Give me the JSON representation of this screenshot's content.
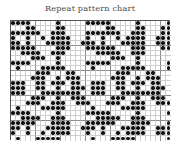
{
  "title": "Repeat pattern chart",
  "colors": {
    "title": "#4a4a4a",
    "dot": "#111111",
    "grid_minor": "#cfcfcf",
    "grid_major": "#8d8d8d",
    "border": "#555555",
    "background": "#ffffff"
  },
  "chart_data": {
    "type": "heatmap",
    "title": "Repeat pattern chart",
    "xlabel": "",
    "ylabel": "",
    "grid": true,
    "legend": "none",
    "columns": 32,
    "rows": 24,
    "major_every": 5,
    "symbol": "filled-dot",
    "values": [
      [
        1,
        1,
        1,
        1,
        0,
        0,
        0,
        0,
        0,
        1,
        0,
        0,
        0,
        0,
        0,
        1,
        1,
        1,
        1,
        1,
        0,
        0,
        0,
        0,
        0,
        1,
        0,
        0,
        0,
        0,
        0,
        1
      ],
      [
        0,
        0,
        0,
        1,
        1,
        0,
        0,
        0,
        0,
        1,
        1,
        0,
        0,
        0,
        0,
        0,
        0,
        0,
        0,
        1,
        1,
        0,
        0,
        0,
        0,
        1,
        1,
        0,
        0,
        0,
        1,
        1
      ],
      [
        1,
        1,
        1,
        1,
        1,
        1,
        0,
        0,
        1,
        1,
        1,
        0,
        0,
        0,
        0,
        1,
        1,
        1,
        1,
        1,
        1,
        1,
        0,
        0,
        1,
        1,
        1,
        0,
        0,
        0,
        1,
        1
      ],
      [
        1,
        0,
        0,
        1,
        0,
        0,
        1,
        0,
        1,
        1,
        1,
        1,
        0,
        0,
        0,
        1,
        0,
        0,
        1,
        0,
        0,
        1,
        0,
        1,
        1,
        1,
        1,
        0,
        0,
        1,
        1,
        1
      ],
      [
        1,
        1,
        0,
        1,
        0,
        0,
        0,
        1,
        1,
        1,
        1,
        1,
        0,
        0,
        1,
        1,
        1,
        0,
        1,
        0,
        0,
        0,
        1,
        1,
        1,
        1,
        1,
        0,
        0,
        1,
        1,
        1
      ],
      [
        1,
        1,
        1,
        1,
        1,
        0,
        0,
        0,
        0,
        1,
        1,
        1,
        0,
        0,
        0,
        1,
        1,
        1,
        1,
        1,
        1,
        0,
        0,
        0,
        1,
        1,
        1,
        0,
        0,
        0,
        1,
        1
      ],
      [
        0,
        0,
        1,
        1,
        1,
        1,
        0,
        0,
        1,
        1,
        1,
        0,
        0,
        0,
        0,
        0,
        0,
        1,
        1,
        1,
        1,
        1,
        0,
        0,
        1,
        1,
        1,
        0,
        0,
        0,
        0,
        0
      ],
      [
        0,
        0,
        0,
        0,
        1,
        1,
        1,
        0,
        0,
        1,
        0,
        0,
        0,
        0,
        0,
        0,
        0,
        0,
        0,
        0,
        1,
        1,
        1,
        0,
        0,
        1,
        0,
        0,
        0,
        0,
        0,
        0
      ],
      [
        1,
        1,
        1,
        1,
        0,
        0,
        0,
        0,
        0,
        1,
        0,
        0,
        0,
        0,
        0,
        1,
        1,
        1,
        1,
        1,
        0,
        0,
        0,
        0,
        0,
        1,
        0,
        0,
        0,
        0,
        0,
        1
      ],
      [
        0,
        1,
        0,
        0,
        0,
        0,
        1,
        1,
        1,
        1,
        1,
        0,
        0,
        0,
        0,
        0,
        1,
        0,
        0,
        0,
        0,
        0,
        1,
        1,
        1,
        1,
        1,
        0,
        0,
        0,
        0,
        1
      ],
      [
        0,
        0,
        0,
        0,
        0,
        1,
        1,
        1,
        0,
        0,
        0,
        1,
        1,
        0,
        0,
        0,
        0,
        0,
        0,
        0,
        0,
        1,
        1,
        1,
        0,
        0,
        0,
        1,
        1,
        0,
        0,
        0
      ],
      [
        0,
        0,
        0,
        0,
        1,
        1,
        1,
        0,
        0,
        1,
        0,
        1,
        1,
        1,
        0,
        0,
        0,
        0,
        0,
        0,
        1,
        1,
        1,
        0,
        0,
        1,
        0,
        1,
        1,
        1,
        0,
        0
      ],
      [
        1,
        1,
        1,
        0,
        0,
        1,
        1,
        0,
        1,
        1,
        1,
        0,
        1,
        1,
        0,
        0,
        1,
        1,
        1,
        0,
        0,
        1,
        1,
        0,
        1,
        1,
        1,
        0,
        1,
        1,
        0,
        0
      ],
      [
        1,
        1,
        1,
        0,
        0,
        1,
        1,
        0,
        0,
        1,
        0,
        0,
        1,
        1,
        1,
        0,
        1,
        1,
        1,
        0,
        0,
        1,
        1,
        0,
        0,
        1,
        0,
        0,
        1,
        1,
        1,
        0
      ],
      [
        1,
        1,
        1,
        0,
        0,
        0,
        1,
        1,
        1,
        1,
        1,
        1,
        1,
        1,
        0,
        0,
        1,
        1,
        1,
        0,
        0,
        0,
        1,
        1,
        1,
        1,
        1,
        1,
        1,
        1,
        0,
        0
      ],
      [
        0,
        0,
        0,
        0,
        1,
        1,
        1,
        0,
        0,
        1,
        0,
        0,
        1,
        1,
        1,
        0,
        0,
        0,
        0,
        0,
        1,
        1,
        1,
        0,
        0,
        1,
        0,
        0,
        1,
        1,
        1,
        0
      ],
      [
        0,
        0,
        0,
        1,
        1,
        1,
        0,
        0,
        1,
        1,
        1,
        0,
        0,
        1,
        1,
        1,
        0,
        0,
        0,
        1,
        1,
        1,
        0,
        0,
        1,
        1,
        1,
        0,
        0,
        1,
        1,
        1
      ],
      [
        0,
        1,
        0,
        0,
        0,
        0,
        1,
        1,
        1,
        1,
        1,
        0,
        0,
        0,
        0,
        0,
        1,
        0,
        0,
        0,
        0,
        0,
        1,
        1,
        1,
        1,
        1,
        0,
        0,
        0,
        0,
        0
      ],
      [
        1,
        1,
        1,
        1,
        0,
        0,
        0,
        0,
        0,
        1,
        0,
        0,
        0,
        0,
        0,
        1,
        1,
        1,
        1,
        1,
        0,
        0,
        0,
        0,
        0,
        1,
        0,
        0,
        0,
        0,
        0,
        1
      ],
      [
        0,
        0,
        1,
        1,
        1,
        1,
        0,
        0,
        1,
        1,
        1,
        0,
        0,
        0,
        0,
        0,
        0,
        1,
        1,
        1,
        1,
        1,
        0,
        0,
        1,
        1,
        1,
        0,
        0,
        0,
        0,
        0
      ],
      [
        1,
        1,
        1,
        1,
        1,
        0,
        0,
        0,
        1,
        1,
        1,
        1,
        0,
        0,
        0,
        1,
        1,
        1,
        1,
        1,
        1,
        0,
        0,
        0,
        1,
        1,
        1,
        1,
        0,
        0,
        0,
        1
      ],
      [
        1,
        1,
        0,
        1,
        0,
        0,
        0,
        1,
        1,
        1,
        1,
        1,
        0,
        0,
        1,
        1,
        1,
        0,
        1,
        0,
        0,
        0,
        1,
        1,
        1,
        1,
        1,
        0,
        0,
        1,
        1,
        1
      ],
      [
        1,
        0,
        0,
        1,
        0,
        0,
        1,
        0,
        1,
        1,
        1,
        1,
        0,
        0,
        0,
        1,
        0,
        0,
        1,
        0,
        0,
        1,
        0,
        1,
        1,
        1,
        1,
        0,
        0,
        1,
        1,
        1
      ],
      [
        0,
        1,
        0,
        0,
        0,
        1,
        1,
        1,
        1,
        1,
        0,
        0,
        0,
        0,
        0,
        0,
        1,
        0,
        0,
        0,
        1,
        1,
        1,
        1,
        1,
        0,
        0,
        0,
        0,
        0,
        0,
        1
      ]
    ]
  }
}
